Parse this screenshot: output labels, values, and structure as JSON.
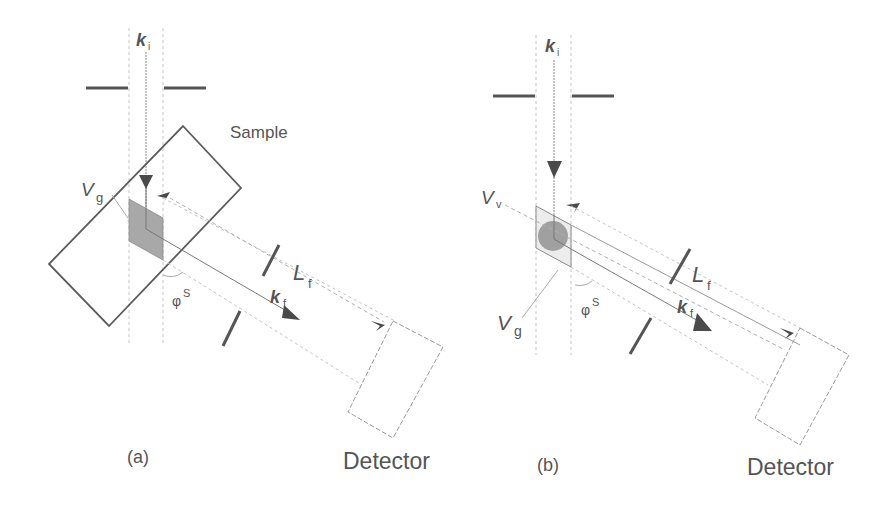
{
  "colors": {
    "line": "#5a5a5a",
    "dashed": "#bdbdbd",
    "slit": "#555555",
    "volume_fill": "#a8a8a8",
    "arrow": "#4a4a4a",
    "text": "#555555",
    "background": "#ffffff"
  },
  "panel_a": {
    "caption": "(a)",
    "incident_vector": "k",
    "incident_sub": "i",
    "sample_label": "Sample",
    "gauge_volume_label": "V",
    "gauge_volume_sub": "g",
    "distance_label": "L",
    "distance_sub": "f",
    "scattered_vector": "k",
    "scattered_sub": "f",
    "angle_label": "φ",
    "angle_sup": "S",
    "detector_label": "Detector"
  },
  "panel_b": {
    "caption": "(b)",
    "incident_vector": "k",
    "incident_sub": "i",
    "void_volume_label": "V",
    "void_volume_sub": "v",
    "gauge_volume_label": "V",
    "gauge_volume_sub": "g",
    "distance_label": "L",
    "distance_sub": "f",
    "scattered_vector": "k",
    "scattered_sub": "f",
    "angle_label": "φ",
    "angle_sup": "S",
    "detector_label": "Detector"
  }
}
